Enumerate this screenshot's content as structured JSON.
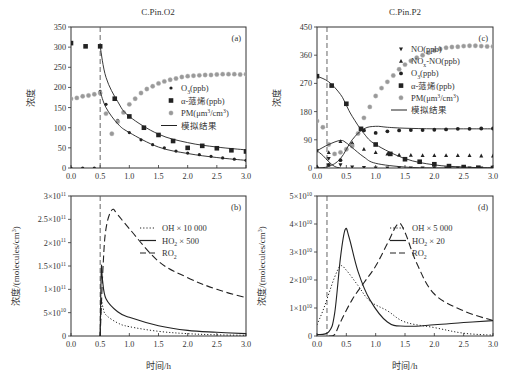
{
  "chart_data": [
    {
      "panel": "a",
      "type": "scatter",
      "title": "C.Pin.O2",
      "panel_label": "(a)",
      "xlabel": "",
      "ylabel": "浓度",
      "xlim": [
        0,
        3.0
      ],
      "ylim": [
        0,
        350
      ],
      "xticks": [
        "0.0",
        "0.5",
        "1.0",
        "1.5",
        "2.0",
        "2.5",
        "3.0"
      ],
      "yticks": [
        "0",
        "50",
        "100",
        "150",
        "200",
        "250",
        "300",
        "350"
      ],
      "vline_x": 0.5,
      "legend": [
        "O3(ppb)",
        "α-蒎烯(ppb)",
        "PM(μm3/cm3)",
        "模拟结果"
      ],
      "series": [
        {
          "name": "O3(ppb)",
          "marker": "small-dot",
          "x": [
            0,
            0.2,
            0.4,
            0.5,
            0.6,
            0.8,
            1.0,
            1.2,
            1.4,
            1.6,
            1.8,
            2.0,
            2.2,
            2.4,
            2.6,
            2.8,
            3.0
          ],
          "y": [
            0,
            0,
            0,
            190,
            158,
            118,
            88,
            70,
            58,
            50,
            42,
            37,
            33,
            29,
            25,
            22,
            19
          ]
        },
        {
          "name": "α-蒎烯(ppb)",
          "marker": "square",
          "x": [
            0,
            0.25,
            0.5,
            0.75,
            1.0,
            1.25,
            1.5,
            1.75,
            2.0,
            2.25,
            2.5,
            2.75,
            3.0
          ],
          "y": [
            310,
            302,
            302,
            172,
            128,
            100,
            82,
            67,
            50,
            55,
            49,
            44,
            41
          ]
        },
        {
          "name": "PM(μm3/cm3)",
          "marker": "gray-dot",
          "x": [
            0,
            0.1,
            0.2,
            0.3,
            0.4,
            0.5,
            0.6,
            0.7,
            0.8,
            0.9,
            1.0,
            1.1,
            1.2,
            1.3,
            1.4,
            1.5,
            1.6,
            1.7,
            1.8,
            1.9,
            2.0,
            2.1,
            2.2,
            2.3,
            2.4,
            2.5,
            2.6,
            2.7,
            2.8,
            2.9,
            3.0
          ],
          "y": [
            172,
            174,
            178,
            180,
            183,
            186,
            135,
            85,
            115,
            138,
            158,
            172,
            186,
            196,
            203,
            210,
            215,
            219,
            222,
            226,
            228,
            229,
            230,
            231,
            231,
            232,
            233,
            233,
            233,
            232,
            233
          ]
        },
        {
          "name": "模拟结果 (O3)",
          "line": "solid",
          "x": [
            0.5,
            0.6,
            0.8,
            1.0,
            1.5,
            2.0,
            2.5,
            3.0
          ],
          "y": [
            190,
            150,
            110,
            88,
            52,
            36,
            26,
            19
          ]
        },
        {
          "name": "模拟结果 (α-蒎烯)",
          "line": "solid",
          "x": [
            0.5,
            0.6,
            0.8,
            1.0,
            1.5,
            2.0,
            2.5,
            3.0
          ],
          "y": [
            302,
            225,
            165,
            128,
            84,
            63,
            52,
            45
          ]
        }
      ]
    },
    {
      "panel": "b",
      "type": "line",
      "panel_label": "(b)",
      "xlabel": "时间/h",
      "ylabel": "浓度/(molecules/cm3)",
      "xlim": [
        0,
        3.0
      ],
      "ylim": [
        0,
        300000000000.0
      ],
      "xticks": [
        "0.0",
        "0.5",
        "1.0",
        "1.5",
        "2.0",
        "2.5",
        "3.0"
      ],
      "yticks": [
        "0",
        "5×10^10",
        "1×10^11",
        "1.5×10^11",
        "2×10^11",
        "2.5×10^11",
        "3×10^11"
      ],
      "vline_x": 0.5,
      "legend": [
        "OH×10 000",
        "HO2×500",
        "RO2"
      ],
      "series": [
        {
          "name": "OH×10 000",
          "line": "dotted",
          "x": [
            0.5,
            0.52,
            0.55,
            0.6,
            0.8,
            1.0,
            1.5,
            2.0,
            2.5,
            3.0
          ],
          "y": [
            0,
            70000000000.0,
            60000000000.0,
            45000000000.0,
            28000000000.0,
            20000000000.0,
            10000000000.0,
            5000000000.0,
            2500000000.0,
            1500000000.0
          ]
        },
        {
          "name": "HO2×500",
          "line": "solid",
          "x": [
            0.5,
            0.52,
            0.54,
            0.6,
            0.8,
            1.0,
            1.5,
            2.0,
            2.5,
            3.0
          ],
          "y": [
            0,
            145000000000.0,
            120000000000.0,
            80000000000.0,
            52000000000.0,
            40000000000.0,
            22000000000.0,
            12000000000.0,
            8000000000.0,
            5000000000.0
          ]
        },
        {
          "name": "RO2",
          "line": "dashed",
          "x": [
            0.5,
            0.55,
            0.6,
            0.7,
            0.8,
            1.0,
            1.5,
            2.0,
            2.5,
            3.0
          ],
          "y": [
            0,
            150000000000.0,
            230000000000.0,
            270000000000.0,
            260000000000.0,
            230000000000.0,
            160000000000.0,
            125000000000.0,
            100000000000.0,
            82000000000.0
          ]
        }
      ]
    },
    {
      "panel": "c",
      "type": "scatter",
      "title": "C.Pin.P2",
      "panel_label": "(c)",
      "xlabel": "",
      "ylabel": "浓度",
      "xlim": [
        0,
        3.0
      ],
      "ylim": [
        0,
        450
      ],
      "xticks": [
        "0.0",
        "0.5",
        "1.0",
        "1.5",
        "2.0",
        "2.5",
        "3.0"
      ],
      "yticks": [
        "0",
        "90",
        "180",
        "270",
        "360",
        "450"
      ],
      "vline_x": 0.17,
      "legend": [
        "NO(ppb)",
        "NOx-NO(ppb)",
        "O3(ppb)",
        "α-蒎烯(ppb)",
        "PM(μm3/cm3)",
        "模拟结果"
      ],
      "series": [
        {
          "name": "NO(ppb)",
          "marker": "triangle-down",
          "x": [
            0,
            0.2,
            0.4,
            0.6,
            0.8,
            1.0,
            1.2,
            1.4,
            1.6,
            1.8,
            2.0,
            2.2,
            2.4,
            2.6,
            2.8,
            3.0
          ],
          "y": [
            55,
            30,
            10,
            3,
            1,
            0,
            0,
            0,
            0,
            0,
            0,
            0,
            0,
            0,
            0,
            0
          ]
        },
        {
          "name": "NOx-NO(ppb)",
          "marker": "triangle-up",
          "x": [
            0,
            0.2,
            0.4,
            0.6,
            0.8,
            1.0,
            1.2,
            1.4,
            1.6,
            1.8,
            2.0,
            2.2,
            2.4,
            2.6,
            2.8,
            3.0
          ],
          "y": [
            5,
            50,
            85,
            80,
            60,
            50,
            45,
            42,
            41,
            40,
            40,
            40,
            40,
            40,
            39,
            39
          ]
        },
        {
          "name": "O3(ppb)",
          "marker": "dot",
          "x": [
            0,
            0.2,
            0.4,
            0.6,
            0.8,
            1.0,
            1.2,
            1.4,
            1.6,
            1.8,
            2.0,
            2.2,
            2.4,
            2.6,
            2.8,
            3.0
          ],
          "y": [
            0,
            10,
            25,
            75,
            120,
            112,
            117,
            120,
            121,
            121,
            122,
            123,
            125,
            125,
            126,
            126
          ]
        },
        {
          "name": "α-蒎烯(ppb)",
          "marker": "square",
          "x": [
            0,
            0.25,
            0.5,
            0.75,
            1.0,
            1.25,
            1.5,
            1.75,
            2.0,
            2.25,
            2.5,
            2.75,
            3.0
          ],
          "y": [
            293,
            263,
            205,
            125,
            75,
            45,
            28,
            20,
            12,
            6,
            3,
            1,
            0
          ]
        },
        {
          "name": "PM(μm3/cm3)",
          "marker": "gray-dot",
          "x": [
            0,
            0.1,
            0.2,
            0.3,
            0.4,
            0.5,
            0.6,
            0.7,
            0.8,
            0.9,
            1.0,
            1.1,
            1.2,
            1.3,
            1.4,
            1.5,
            1.6,
            1.7,
            1.8,
            1.9,
            2.0,
            2.1,
            2.2,
            2.3,
            2.4,
            2.5,
            2.6,
            2.7,
            2.8,
            2.9,
            3.0
          ],
          "y": [
            150,
            130,
            75,
            45,
            50,
            60,
            70,
            110,
            160,
            195,
            230,
            255,
            275,
            295,
            315,
            330,
            342,
            352,
            360,
            368,
            375,
            380,
            384,
            386,
            387,
            389,
            390,
            390,
            389,
            388,
            388
          ]
        },
        {
          "name": "模拟结果 (α-蒎烯)",
          "line": "solid",
          "x": [
            0,
            0.2,
            0.4,
            0.5,
            0.6,
            0.8,
            1.0,
            1.5,
            2.0,
            2.5,
            3.0
          ],
          "y": [
            293,
            275,
            235,
            200,
            165,
            110,
            75,
            30,
            10,
            3,
            0
          ]
        },
        {
          "name": "模拟结果 (O3)",
          "line": "solid",
          "x": [
            0,
            0.2,
            0.4,
            0.6,
            0.8,
            1.0,
            1.2,
            1.5,
            2.0,
            2.5,
            3.0
          ],
          "y": [
            0,
            5,
            30,
            90,
            125,
            133,
            130,
            127,
            125,
            125,
            125
          ]
        },
        {
          "name": "模拟结果 (NOx-NO)",
          "line": "solid",
          "x": [
            0,
            0.2,
            0.4,
            0.5,
            0.6,
            0.8,
            1.0,
            1.5,
            2.0,
            2.5,
            3.0
          ],
          "y": [
            55,
            75,
            88,
            80,
            65,
            35,
            15,
            3,
            0,
            0,
            0
          ]
        },
        {
          "name": "模拟结果 (NO)",
          "line": "solid",
          "x": [
            0,
            0.1,
            0.2,
            0.3,
            0.4
          ],
          "y": [
            55,
            40,
            20,
            5,
            0
          ]
        }
      ]
    },
    {
      "panel": "d",
      "type": "line",
      "panel_label": "(d)",
      "xlabel": "时间/h",
      "ylabel": "浓度/(molecules/cm3)",
      "xlim": [
        0,
        3.0
      ],
      "ylim": [
        0,
        50000000000.0
      ],
      "xticks": [
        "0.0",
        "0.5",
        "1.0",
        "1.5",
        "2.0",
        "2.5",
        "3.0"
      ],
      "yticks": [
        "0",
        "1×10^10",
        "2×10^10",
        "3×10^10",
        "4×10^10",
        "5×10^10"
      ],
      "vline_x": 0.17,
      "legend": [
        "OH×5 000",
        "HO2×20",
        "RO2"
      ],
      "series": [
        {
          "name": "OH×5 000",
          "line": "dotted",
          "x": [
            0,
            0.1,
            0.2,
            0.3,
            0.4,
            0.5,
            0.7,
            0.9,
            1.2,
            1.5,
            2.0,
            2.5,
            3.0
          ],
          "y": [
            4000000000.0,
            9000000000.0,
            15000000000.0,
            21000000000.0,
            25000000000.0,
            23500000000.0,
            18000000000.0,
            12500000000.0,
            9000000000.0,
            5000000000.0,
            3000000000.0,
            1000000000.0,
            300000000.0
          ]
        },
        {
          "name": "HO2×20",
          "line": "solid",
          "x": [
            0,
            0.2,
            0.3,
            0.4,
            0.48,
            0.55,
            0.7,
            0.9,
            1.2,
            1.5,
            2.0,
            2.5,
            3.0
          ],
          "y": [
            500000000.0,
            1500000000.0,
            8000000000.0,
            28000000000.0,
            38000000000.0,
            35000000000.0,
            23000000000.0,
            13000000000.0,
            5000000000.0,
            3500000000.0,
            4000000000.0,
            4800000000.0,
            5500000000.0
          ]
        },
        {
          "name": "RO2",
          "line": "dashed",
          "x": [
            0.2,
            0.3,
            0.4,
            0.6,
            0.8,
            1.0,
            1.2,
            1.38,
            1.5,
            1.7,
            2.0,
            2.5,
            3.0
          ],
          "y": [
            0,
            500000000.0,
            5000000000.0,
            13000000000.0,
            19000000000.0,
            25000000000.0,
            33000000000.0,
            40000000000.0,
            37000000000.0,
            26000000000.0,
            15000000000.0,
            9000000000.0,
            5500000000.0
          ]
        }
      ]
    }
  ],
  "colors": {
    "axis": "#333333",
    "data": "#222222",
    "pm": "#999999",
    "vline": "#555555"
  }
}
